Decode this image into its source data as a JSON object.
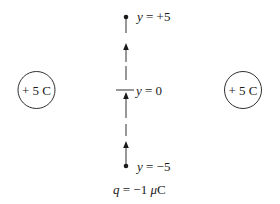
{
  "diagram": {
    "charges": [
      {
        "id": "left-charge",
        "label": "+ 5 C",
        "cx": 36.5,
        "cy": 90,
        "r": 18.5
      },
      {
        "id": "right-charge",
        "label": "+ 5 C",
        "cx": 243,
        "cy": 90,
        "r": 18.5
      }
    ],
    "path": {
      "x": 126,
      "points": [
        {
          "id": "top",
          "var": "y",
          "eq": " = +5",
          "y": 17
        },
        {
          "id": "origin",
          "var": "y",
          "eq": " = 0",
          "y": 90
        },
        {
          "id": "bottom",
          "var": "y",
          "eq": " = −5",
          "y": 166
        }
      ],
      "direction": "upward"
    },
    "test_charge": {
      "var": "q",
      "value": " = −1 ",
      "mu": "μ",
      "unit": "C"
    },
    "colors": {
      "ink": "#1a1a1a",
      "background": "#ffffff"
    }
  }
}
